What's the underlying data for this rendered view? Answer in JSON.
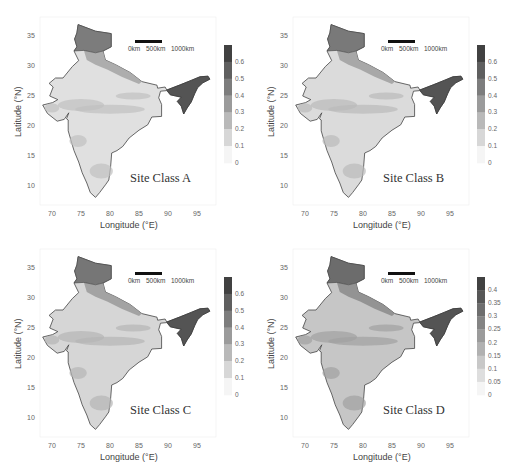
{
  "chart_data": [
    {
      "type": "heatmap",
      "title": "Site Class A",
      "xlabel": "Longitude (°E)",
      "ylabel": "Latitude (°N)",
      "xticks": [
        "70",
        "75",
        "80",
        "85",
        "90",
        "95"
      ],
      "yticks": [
        "35",
        "30",
        "25",
        "20",
        "15",
        "10"
      ],
      "xlim": [
        68,
        98
      ],
      "ylim": [
        7,
        37
      ],
      "scale_bar": [
        "0km",
        "500km",
        "1000km"
      ],
      "colorbar": {
        "ticks": [
          "0.6",
          "0.5",
          "0.4",
          "0.3",
          "0.2",
          "0.1",
          "0"
        ],
        "range": [
          0,
          0.7
        ]
      },
      "grid": false
    },
    {
      "type": "heatmap",
      "title": "Site Class B",
      "xlabel": "Longitude (°E)",
      "ylabel": "Latitude (°N)",
      "xticks": [
        "70",
        "75",
        "80",
        "85",
        "90",
        "95"
      ],
      "yticks": [
        "35",
        "30",
        "25",
        "20",
        "15",
        "10"
      ],
      "xlim": [
        68,
        98
      ],
      "ylim": [
        7,
        37
      ],
      "scale_bar": [
        "0km",
        "500km",
        "1000km"
      ],
      "colorbar": {
        "ticks": [
          "0.6",
          "0.5",
          "0.4",
          "0.3",
          "0.2",
          "0.1",
          "0"
        ],
        "range": [
          0,
          0.7
        ]
      },
      "grid": false
    },
    {
      "type": "heatmap",
      "title": "Site Class C",
      "xlabel": "Longitude (°E)",
      "ylabel": "Latitude (°N)",
      "xticks": [
        "70",
        "75",
        "80",
        "85",
        "90",
        "95"
      ],
      "yticks": [
        "35",
        "30",
        "25",
        "20",
        "15",
        "10"
      ],
      "xlim": [
        68,
        98
      ],
      "ylim": [
        7,
        37
      ],
      "scale_bar": [
        "0km",
        "500km",
        "1000km"
      ],
      "colorbar": {
        "ticks": [
          "0.6",
          "0.5",
          "0.4",
          "0.3",
          "0.2",
          "0.1",
          "0"
        ],
        "range": [
          0,
          0.7
        ]
      },
      "grid": false
    },
    {
      "type": "heatmap",
      "title": "Site Class D",
      "xlabel": "Longitude (°E)",
      "ylabel": "Latitude (°N)",
      "xticks": [
        "70",
        "75",
        "80",
        "85",
        "90",
        "95"
      ],
      "yticks": [
        "35",
        "30",
        "25",
        "20",
        "15",
        "10"
      ],
      "xlim": [
        68,
        98
      ],
      "ylim": [
        7,
        37
      ],
      "scale_bar": [
        "0km",
        "500km",
        "1000km"
      ],
      "colorbar": {
        "ticks": [
          "0.4",
          "0.35",
          "0.3",
          "0.25",
          "0.2",
          "0.15",
          "0.1",
          "0.05",
          "0"
        ],
        "range": [
          0,
          0.45
        ]
      },
      "grid": false
    }
  ],
  "panels": {
    "a": {
      "title": "Site Class A",
      "xlabel": "Longitude (°E)",
      "ylabel": "Latitude (°N)"
    },
    "b": {
      "title": "Site Class B",
      "xlabel": "Longitude (°E)",
      "ylabel": "Latitude (°N)"
    },
    "c": {
      "title": "Site Class C",
      "xlabel": "Longitude (°E)",
      "ylabel": "Latitude (°N)"
    },
    "d": {
      "title": "Site Class D",
      "xlabel": "Longitude (°E)",
      "ylabel": "Latitude (°N)"
    }
  },
  "ticks": {
    "x": [
      "70",
      "75",
      "80",
      "85",
      "90",
      "95"
    ],
    "y": [
      "35",
      "30",
      "25",
      "20",
      "15",
      "10"
    ]
  },
  "scale_bar": {
    "zero": "0km",
    "mid": "500km",
    "end": "1000km"
  },
  "colorbar_abc": [
    "0.6",
    "0.5",
    "0.4",
    "0.3",
    "0.2",
    "0.1",
    "0"
  ],
  "colorbar_d": [
    "0.4",
    "0.35",
    "0.3",
    "0.25",
    "0.2",
    "0.15",
    "0.1",
    "0.05",
    "0"
  ],
  "colors": {
    "map_light": "#f4f4f4",
    "map_mid": "#b5b5b5",
    "map_dark": "#555555",
    "border": "#444444"
  }
}
